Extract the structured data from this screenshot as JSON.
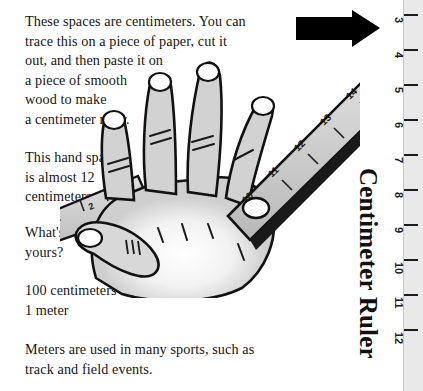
{
  "page": {
    "background_color": "#ffffff",
    "text_color": "#161616"
  },
  "body_text": {
    "para_intro": "These spaces are centimeters. You can\ntrace this on a piece of paper, cut it\nout, and then paste it on\na piece of smooth\nwood to make\na centimeter ruler.",
    "para_hand_span": "This hand span\nis almost 12\ncentimeters.",
    "para_whats_yours": "What's\nyours?",
    "para_conversion": "100 centimeters =\n1 meter",
    "para_meters_sports": "Meters are used in many sports, such as\ntrack and field events."
  },
  "vertical_label": {
    "title": "Centimeter Ruler"
  },
  "arrow": {
    "icon": "right-arrow-icon",
    "color": "#000000",
    "direction": "right"
  },
  "illustration": {
    "name": "hand-with-ruler-illustration",
    "description": "open hand spread with diagonal centimeter ruler across it",
    "ruler_numbers_on_diagonal": [
      "2",
      "3",
      "10",
      "11",
      "12",
      "13",
      "14"
    ],
    "fill_color": "#c9c9c9",
    "outline_color": "#111111"
  },
  "ruler_strip": {
    "background_color": "#e9e9e9",
    "tick_color": "#1b1b1b",
    "marks": [
      {
        "label": "3",
        "y": 14
      },
      {
        "label": "4",
        "y": 49
      },
      {
        "label": "5",
        "y": 84
      },
      {
        "label": "6",
        "y": 119
      },
      {
        "label": "7",
        "y": 154
      },
      {
        "label": "8",
        "y": 189
      },
      {
        "label": "9",
        "y": 224
      },
      {
        "label": "10",
        "y": 259
      },
      {
        "label": "11",
        "y": 294
      },
      {
        "label": "12",
        "y": 329
      }
    ]
  }
}
